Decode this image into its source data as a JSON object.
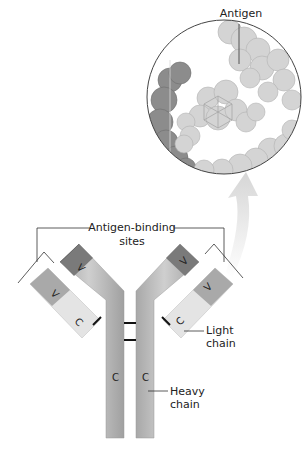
{
  "diagram": {
    "title_labels": {
      "antigen": "Antigen",
      "binding_sites_line1": "Antigen-binding",
      "binding_sites_line2": "sites",
      "light_chain_line1": "Light",
      "light_chain_line2": "chain",
      "heavy_chain_line1": "Heavy",
      "heavy_chain_line2": "chain"
    },
    "region_letters": {
      "variable": "V",
      "constant": "C"
    },
    "colors": {
      "heavy_chain": "#bdbdbd",
      "heavy_variable": "#7a7a7a",
      "light_variable": "#a9a9a9",
      "light_constant": "#e6e6e6",
      "antigen_atoms": "#d0d0d0",
      "antibody_atoms_in_zoom": "#8a8a8a",
      "arrow": "#dcdcdc",
      "disulfide_bond": "#111111",
      "leader_lines": "#333333"
    }
  }
}
